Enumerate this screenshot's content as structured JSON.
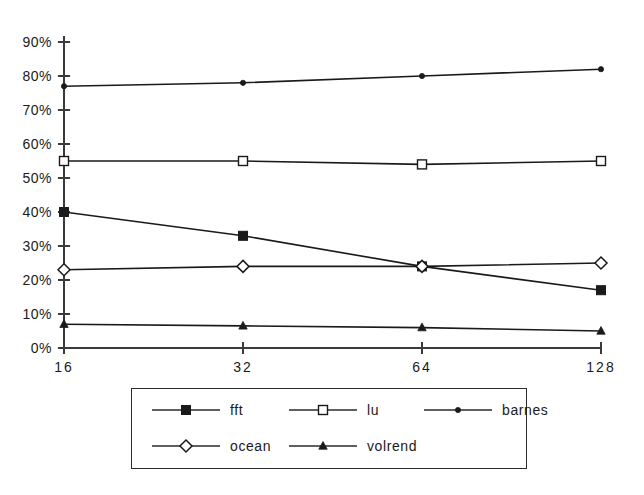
{
  "chart_data": {
    "type": "line",
    "title": "",
    "subtitle": "",
    "xlabel": "",
    "ylabel": "",
    "categories": [
      "16",
      "32",
      "64",
      "128"
    ],
    "x_tick_labels": [
      "16",
      "32",
      "64",
      "128"
    ],
    "y_tick_labels": [
      "0%",
      "10%",
      "20%",
      "30%",
      "40%",
      "50%",
      "60%",
      "70%",
      "80%",
      "90%"
    ],
    "y_tick_values": [
      0,
      10,
      20,
      30,
      40,
      50,
      60,
      70,
      80,
      90
    ],
    "ylim": [
      0,
      90
    ],
    "y_unit": "%",
    "grid": false,
    "legend_position": "bottom",
    "series": [
      {
        "name": "fft",
        "marker": "filled-square",
        "color": "#1a1a1a",
        "values": [
          40,
          33,
          24,
          17
        ]
      },
      {
        "name": "lu",
        "marker": "open-square",
        "color": "#1a1a1a",
        "values": [
          55,
          55,
          54,
          55
        ]
      },
      {
        "name": "barnes",
        "marker": "filled-dot",
        "color": "#1a1a1a",
        "values": [
          77,
          78,
          80,
          82
        ]
      },
      {
        "name": "ocean",
        "marker": "open-diamond",
        "color": "#1a1a1a",
        "values": [
          23,
          24,
          24,
          25
        ]
      },
      {
        "name": "volrend",
        "marker": "filled-triangle",
        "color": "#1a1a1a",
        "values": [
          7,
          6.5,
          6,
          5
        ]
      }
    ]
  },
  "legend": {
    "entries": [
      {
        "label": "fft",
        "marker": "filled-square"
      },
      {
        "label": "lu",
        "marker": "open-square"
      },
      {
        "label": "barnes",
        "marker": "filled-dot"
      },
      {
        "label": "ocean",
        "marker": "open-diamond"
      },
      {
        "label": "volrend",
        "marker": "filled-triangle"
      }
    ]
  },
  "colors": {
    "background": "#ffffff",
    "ink": "#1a1a1a",
    "axis": "#3a3a3a",
    "series_line": "#2b2b2b"
  }
}
